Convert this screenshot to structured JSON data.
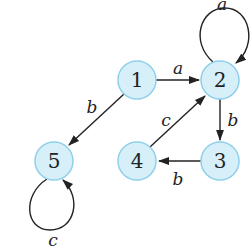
{
  "diagram": {
    "type": "directed-graph",
    "nodes": [
      {
        "id": "1",
        "label": "1",
        "x": 137,
        "y": 80
      },
      {
        "id": "2",
        "label": "2",
        "x": 220,
        "y": 80
      },
      {
        "id": "3",
        "label": "3",
        "x": 220,
        "y": 161
      },
      {
        "id": "4",
        "label": "4",
        "x": 137,
        "y": 161
      },
      {
        "id": "5",
        "label": "5",
        "x": 54,
        "y": 161
      }
    ],
    "edges": [
      {
        "from": "1",
        "to": "2",
        "label": "a"
      },
      {
        "from": "2",
        "to": "2",
        "label": "a"
      },
      {
        "from": "1",
        "to": "5",
        "label": "b"
      },
      {
        "from": "2",
        "to": "3",
        "label": "b"
      },
      {
        "from": "3",
        "to": "4",
        "label": "b"
      },
      {
        "from": "4",
        "to": "2",
        "label": "c"
      },
      {
        "from": "5",
        "to": "5",
        "label": "c"
      }
    ],
    "colors": {
      "node_fill": "#d6eff9",
      "node_stroke": "#8fd0ea",
      "edge": "#222222"
    }
  }
}
